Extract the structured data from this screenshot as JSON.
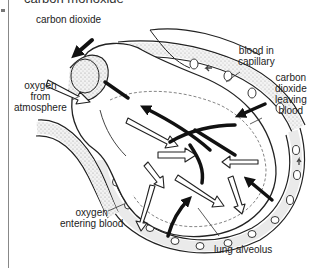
{
  "heading": "carbon monoxide",
  "labels": {
    "carbon_dioxide_top": "carbon dioxide",
    "blood_in_capillary_1": "blood in",
    "blood_in_capillary_2": "capillary",
    "co2_leaving_1": "carbon",
    "co2_leaving_2": "dioxide",
    "co2_leaving_3": "leaving",
    "co2_leaving_4": "blood",
    "oxygen_atm_1": "oxygen",
    "oxygen_atm_2": "from",
    "oxygen_atm_3": "atmosphere",
    "oxygen_entering_1": "oxygen",
    "oxygen_entering_2": "entering blood",
    "lung_alveolus": "lung alveolus"
  },
  "colors": {
    "line": "#222222",
    "shade": "#cfcfcf",
    "background": "#ffffff"
  }
}
